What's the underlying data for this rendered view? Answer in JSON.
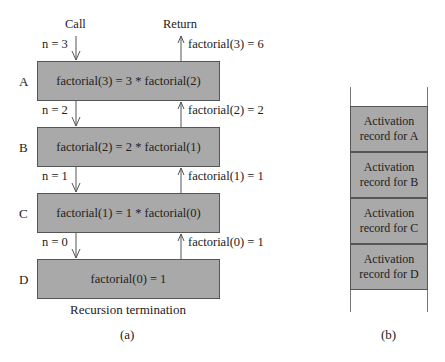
{
  "panel_a": {
    "headers": {
      "call": "Call",
      "return": "Return"
    },
    "frames": [
      {
        "label": "A",
        "expr": "factorial(3) = 3 * factorial(2)",
        "call_arg": "n = 3",
        "return_val": "factorial(3) = 6"
      },
      {
        "label": "B",
        "expr": "factorial(2) = 2 * factorial(1)",
        "call_arg": "n = 2",
        "return_val": "factorial(2) = 2"
      },
      {
        "label": "C",
        "expr": "factorial(1) = 1 * factorial(0)",
        "call_arg": "n = 1",
        "return_val": "factorial(1) = 1"
      },
      {
        "label": "D",
        "expr": "factorial(0) = 1",
        "call_arg": "n = 0",
        "return_val": "factorial(0) = 1"
      }
    ],
    "footer": "Recursion termination",
    "caption": "(a)"
  },
  "panel_b": {
    "records": [
      {
        "line1": "Activation",
        "line2": "record for A"
      },
      {
        "line1": "Activation",
        "line2": "record for B"
      },
      {
        "line1": "Activation",
        "line2": "record for C"
      },
      {
        "line1": "Activation",
        "line2": "record for D"
      }
    ],
    "caption": "(b)"
  },
  "colors": {
    "box_fill": "#a9a9a9",
    "stroke": "#555555"
  }
}
